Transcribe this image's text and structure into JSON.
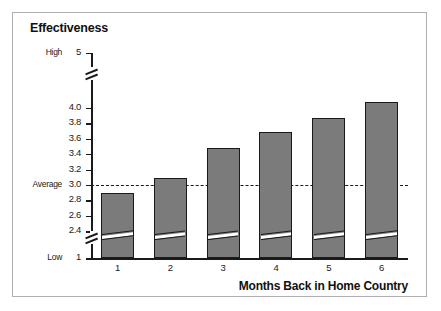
{
  "figure": {
    "frame_border_color": "#b0b0b0",
    "background_color": "#ffffff"
  },
  "chart_data": {
    "type": "bar",
    "title": "Effectiveness",
    "xlabel": "Months Back in Home Country",
    "ylabel": "Effectiveness",
    "categories": [
      "1",
      "2",
      "3",
      "4",
      "5",
      "6"
    ],
    "values": [
      2.89,
      3.09,
      3.48,
      3.68,
      3.87,
      4.08
    ],
    "series": [
      {
        "name": "Effectiveness",
        "values": [
          2.89,
          3.09,
          3.48,
          3.68,
          3.87,
          4.08
        ]
      }
    ],
    "ylim": [
      2.3,
      4.12
    ],
    "yticks": [
      "4.0",
      "3.8",
      "3.6",
      "3.4",
      "3.2",
      "3.0",
      "2.8",
      "2.6",
      "2.4"
    ],
    "ytick_values": [
      4.0,
      3.8,
      3.6,
      3.4,
      3.2,
      3.0,
      2.8,
      2.6,
      2.4
    ],
    "y_top_label": "5",
    "y_top_word": "High",
    "y_bottom_label": "1",
    "y_bottom_word": "Low",
    "y_average_word": "Average",
    "y_average_value": 3.0,
    "axis_break": true,
    "grid": false,
    "legend": false,
    "reference_line": {
      "label": "Average",
      "value": "3.0",
      "style": "dashed"
    },
    "bar_fill_color": "#7b7b7b",
    "bar_edge_color": "#1a1a1a",
    "annotations": [
      "Bars drawn with an axis-break notch near the baseline"
    ]
  }
}
